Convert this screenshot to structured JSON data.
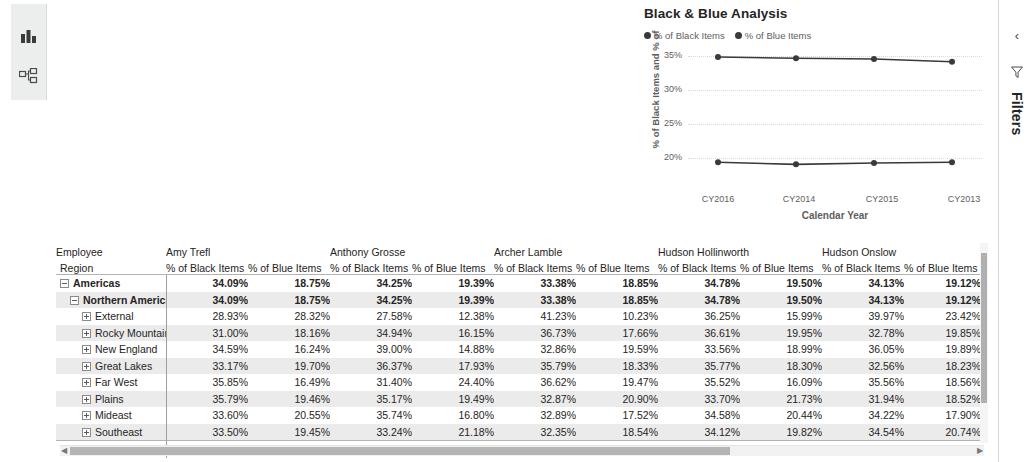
{
  "left_rail": {
    "items": [
      {
        "name": "report-view",
        "icon": "bar-chart-icon"
      },
      {
        "name": "model-view",
        "icon": "relationships-icon"
      }
    ]
  },
  "filters_pane": {
    "label": "Filters",
    "expand_icon": "chevron-left-icon",
    "funnel_icon": "filter-funnel-icon"
  },
  "chart": {
    "title": "Black & Blue Analysis"
  },
  "chart_data": {
    "type": "line",
    "title": "Black & Blue Analysis",
    "xlabel": "Calendar Year",
    "ylabel": "% of Black Items and % of ",
    "categories": [
      "CY2016",
      "CY2014",
      "CY2015",
      "CY2013"
    ],
    "ylim": [
      17.5,
      36.5
    ],
    "yticks": [
      "20%",
      "25%",
      "30%",
      "35%"
    ],
    "ytick_values": [
      20,
      25,
      30,
      35
    ],
    "grid": true,
    "legend_position": "top-left",
    "series": [
      {
        "name": "% of Black Items",
        "color": "#3a3a3a",
        "values": [
          34.9,
          34.7,
          34.6,
          34.2
        ]
      },
      {
        "name": "% of Blue Items",
        "color": "#3a3a3a",
        "values": [
          19.5,
          19.2,
          19.4,
          19.5
        ]
      }
    ]
  },
  "matrix": {
    "row_header_top": "Employee",
    "row_header_bottom": "Region",
    "employees": [
      "Amy Trefl",
      "Anthony Grosse",
      "Archer Lamble",
      "Hudson Hollinworth",
      "Hudson Onslow"
    ],
    "measures": [
      "% of Black Items",
      "% of Blue Items"
    ],
    "rows": [
      {
        "label": "Americas",
        "level": 1,
        "expander": "minus",
        "bold": true,
        "band": false,
        "values": [
          "34.09%",
          "18.75%",
          "34.25%",
          "19.39%",
          "33.38%",
          "18.85%",
          "34.78%",
          "19.50%",
          "34.13%",
          "19.12%"
        ]
      },
      {
        "label": "Northern America",
        "level": 2,
        "expander": "minus",
        "bold": true,
        "band": true,
        "values": [
          "34.09%",
          "18.75%",
          "34.25%",
          "19.39%",
          "33.38%",
          "18.85%",
          "34.78%",
          "19.50%",
          "34.13%",
          "19.12%"
        ]
      },
      {
        "label": "External",
        "level": 3,
        "expander": "plus",
        "bold": false,
        "band": false,
        "values": [
          "28.93%",
          "28.32%",
          "27.58%",
          "12.38%",
          "41.23%",
          "10.23%",
          "36.25%",
          "15.99%",
          "39.97%",
          "23.42%"
        ]
      },
      {
        "label": "Rocky Mountain",
        "level": 3,
        "expander": "plus",
        "bold": false,
        "band": true,
        "values": [
          "31.00%",
          "18.16%",
          "34.94%",
          "16.15%",
          "36.73%",
          "17.66%",
          "36.61%",
          "19.95%",
          "32.78%",
          "19.85%"
        ]
      },
      {
        "label": "New England",
        "level": 3,
        "expander": "plus",
        "bold": false,
        "band": false,
        "values": [
          "34.59%",
          "16.24%",
          "39.00%",
          "14.88%",
          "32.86%",
          "19.59%",
          "33.56%",
          "18.99%",
          "36.05%",
          "19.89%"
        ]
      },
      {
        "label": "Great Lakes",
        "level": 3,
        "expander": "plus",
        "bold": false,
        "band": true,
        "values": [
          "33.17%",
          "19.70%",
          "36.37%",
          "17.93%",
          "35.79%",
          "18.33%",
          "35.77%",
          "18.30%",
          "32.56%",
          "18.23%"
        ]
      },
      {
        "label": "Far West",
        "level": 3,
        "expander": "plus",
        "bold": false,
        "band": false,
        "values": [
          "35.85%",
          "16.49%",
          "31.40%",
          "24.40%",
          "36.62%",
          "19.47%",
          "35.52%",
          "16.09%",
          "35.56%",
          "18.56%"
        ]
      },
      {
        "label": "Plains",
        "level": 3,
        "expander": "plus",
        "bold": false,
        "band": true,
        "values": [
          "35.79%",
          "19.46%",
          "35.17%",
          "19.49%",
          "32.87%",
          "20.90%",
          "33.70%",
          "21.73%",
          "31.94%",
          "18.52%"
        ]
      },
      {
        "label": "Mideast",
        "level": 3,
        "expander": "plus",
        "bold": false,
        "band": false,
        "values": [
          "33.60%",
          "20.55%",
          "35.74%",
          "16.80%",
          "32.89%",
          "17.52%",
          "34.58%",
          "20.44%",
          "34.22%",
          "17.90%"
        ]
      },
      {
        "label": "Southeast",
        "level": 3,
        "expander": "plus",
        "bold": false,
        "band": true,
        "values": [
          "33.50%",
          "19.45%",
          "33.24%",
          "21.18%",
          "32.35%",
          "18.54%",
          "34.12%",
          "19.82%",
          "34.54%",
          "20.74%"
        ]
      }
    ],
    "total_row": {
      "label": "Total",
      "values": [
        "34.09%",
        "18.75%",
        "34.25%",
        "19.39%",
        "33.38%",
        "18.85%",
        "34.78%",
        "19.50%",
        "34.13%",
        "19.12%"
      ]
    }
  }
}
